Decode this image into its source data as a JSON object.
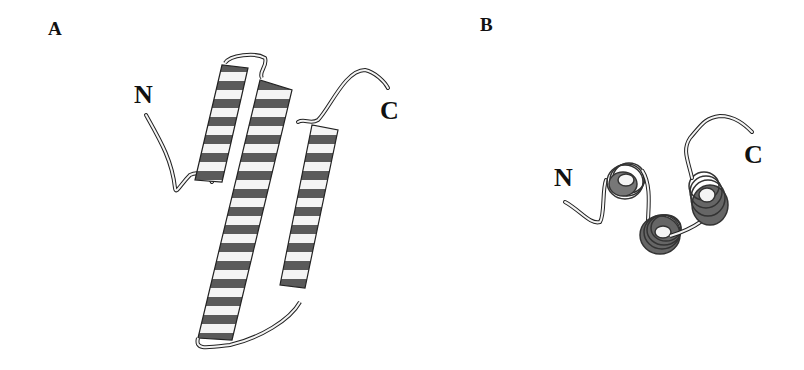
{
  "figure": {
    "panels": [
      {
        "id": "A",
        "label": "A",
        "n_terminus": "N",
        "c_terminus": "C",
        "description": "three-helix bundle ribbon diagram, side view"
      },
      {
        "id": "B",
        "label": "B",
        "n_terminus": "N",
        "c_terminus": "C",
        "description": "three-helix bundle ribbon diagram, top view down helix axes"
      }
    ],
    "colors": {
      "ribbon_light": "#f4f4f4",
      "ribbon_dark": "#555555",
      "outline": "#222222",
      "background": "#ffffff"
    }
  }
}
